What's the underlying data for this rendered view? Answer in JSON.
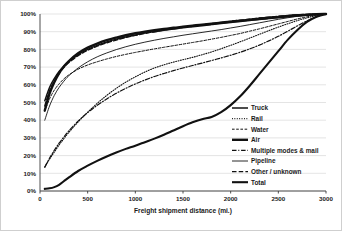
{
  "chart_data": {
    "type": "line",
    "title": "",
    "xlabel": "Freight shipment distance (mi.)",
    "ylabel": "",
    "xlim": [
      0,
      3000
    ],
    "ylim": [
      0,
      100
    ],
    "xticks": [
      "0",
      "500",
      "1000",
      "1500",
      "2000",
      "2500",
      "3000"
    ],
    "yticks": [
      "0%",
      "10%",
      "20%",
      "30%",
      "40%",
      "50%",
      "60%",
      "70%",
      "80%",
      "90%",
      "100%"
    ],
    "grid": "horizontal",
    "legend_position": "inside-right",
    "x": [
      50,
      100,
      150,
      200,
      250,
      300,
      400,
      500,
      600,
      700,
      800,
      900,
      1000,
      1100,
      1200,
      1300,
      1400,
      1500,
      1600,
      1700,
      1800,
      1900,
      2000,
      2100,
      2200,
      2300,
      2400,
      2500,
      2600,
      2700,
      2800,
      2900,
      3000
    ],
    "series": [
      {
        "name": "Truck",
        "style": "solid",
        "width": 1.5,
        "values": [
          51,
          58.5,
          63.5,
          67.5,
          70.5,
          73,
          77,
          80,
          82.3,
          84.2,
          85.8,
          87,
          88.2,
          89.2,
          90,
          90.8,
          91.5,
          92.2,
          92.8,
          93.4,
          94,
          94.6,
          95.2,
          95.8,
          96.3,
          96.9,
          97.4,
          97.9,
          98.4,
          98.9,
          99.3,
          99.7,
          100
        ]
      },
      {
        "name": "Rail",
        "style": "dotted",
        "width": 1.1,
        "values": [
          13.5,
          18,
          22,
          26,
          29.5,
          33,
          39,
          44.5,
          49.5,
          54,
          58,
          61.5,
          64.5,
          67.2,
          69.5,
          71.3,
          72.8,
          74.2,
          75.5,
          77,
          78.6,
          80.4,
          82.3,
          84.3,
          86.4,
          88.5,
          90.6,
          92.6,
          94.5,
          96.3,
          97.8,
          99.1,
          100
        ]
      },
      {
        "name": "Water",
        "style": "dashed-fine",
        "width": 1.0,
        "values": [
          45,
          52,
          57,
          60.5,
          63.3,
          65.5,
          68.8,
          71.2,
          73,
          74.6,
          76,
          77.2,
          78.3,
          79.3,
          80.3,
          81.2,
          82.1,
          83,
          83.9,
          84.8,
          85.8,
          86.8,
          87.9,
          89,
          90.3,
          91.6,
          93,
          94.4,
          95.8,
          97.2,
          98.4,
          99.4,
          100
        ]
      },
      {
        "name": "Air",
        "style": "solid-thick",
        "width": 2.4,
        "values": [
          45.5,
          55,
          61.5,
          66.5,
          70.3,
          73.3,
          77.8,
          81,
          83.3,
          85.2,
          86.7,
          88,
          89.1,
          90,
          90.8,
          91.5,
          92.2,
          92.8,
          93.4,
          94,
          94.5,
          95.1,
          95.7,
          96.2,
          96.8,
          97.3,
          97.9,
          98.4,
          98.9,
          99.3,
          99.6,
          99.9,
          100
        ]
      },
      {
        "name": "Multiple modes & mail",
        "style": "dash-dot",
        "width": 1.2,
        "values": [
          13.5,
          18.5,
          23,
          27,
          30.5,
          33.8,
          39.5,
          44.3,
          48.4,
          52,
          55.2,
          58,
          60.5,
          62.7,
          64.7,
          66.4,
          68,
          69.5,
          70.9,
          72.3,
          73.7,
          75.2,
          76.7,
          78.4,
          80.3,
          82.4,
          84.8,
          87.4,
          90.3,
          93.3,
          96.1,
          98.4,
          100
        ]
      },
      {
        "name": "Pipeline",
        "style": "solid-thin",
        "width": 0.9,
        "values": [
          40,
          48,
          54,
          58.5,
          62,
          65,
          69.5,
          73,
          75.8,
          78,
          79.9,
          81.5,
          82.9,
          84.1,
          85.2,
          86.2,
          87.1,
          88,
          88.8,
          89.6,
          90.4,
          91.2,
          92.1,
          93,
          94,
          95,
          96,
          97,
          97.9,
          98.7,
          99.3,
          99.8,
          100
        ]
      },
      {
        "name": "Other / unknown",
        "style": "dashed-coarse",
        "width": 1.4,
        "values": [
          48,
          56.5,
          62,
          66.5,
          69.8,
          72.5,
          76.5,
          79.5,
          81.8,
          83.7,
          85.3,
          86.7,
          87.9,
          89,
          90,
          90.9,
          91.7,
          92.5,
          93.2,
          93.9,
          94.6,
          95.2,
          95.9,
          96.5,
          97.1,
          97.7,
          98.2,
          98.7,
          99.1,
          99.5,
          99.8,
          99.95,
          100
        ]
      },
      {
        "name": "Total",
        "style": "solid-bold",
        "width": 2.1,
        "values": [
          1.2,
          1.5,
          2.2,
          3.5,
          5.5,
          7.5,
          11.3,
          14.3,
          17,
          19.5,
          21.8,
          23.8,
          25.6,
          27.6,
          29.6,
          31.8,
          34.2,
          36.6,
          38.8,
          40.6,
          41.8,
          44.5,
          48.5,
          53.5,
          59.5,
          66,
          72.5,
          79,
          85.5,
          91,
          95.5,
          98.5,
          100
        ]
      }
    ]
  },
  "legend": {
    "items": [
      {
        "label": "Truck"
      },
      {
        "label": "Rail"
      },
      {
        "label": "Water"
      },
      {
        "label": "Air"
      },
      {
        "label": "Multiple modes & mail"
      },
      {
        "label": "Pipeline"
      },
      {
        "label": "Other / unknown"
      },
      {
        "label": "Total"
      }
    ]
  }
}
